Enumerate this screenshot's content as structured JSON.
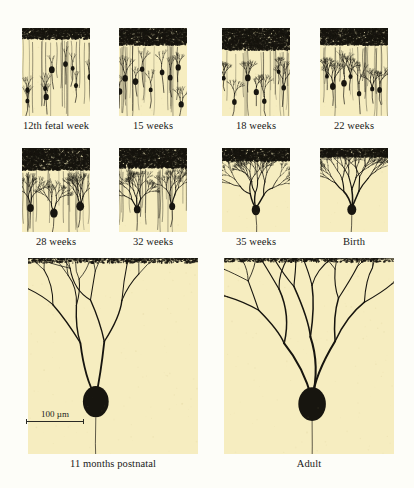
{
  "figure": {
    "background_color": "#fdfdf8",
    "panel_color": "#f6edc0",
    "ink_color": "#17150f"
  },
  "scale_bar": {
    "label": "100 µm",
    "length_um": 100,
    "panel": "11 months postnatal"
  },
  "panels": [
    {
      "id": "p1",
      "caption": "12th fetal week",
      "row": 1,
      "col": 1,
      "x": 22,
      "y": 28,
      "w": 68,
      "h": 88,
      "caption_y": 120,
      "granular_band_h": 11,
      "cell_count": 9,
      "arbor_stage": 0.05,
      "seed": 11
    },
    {
      "id": "p2",
      "caption": "15 weeks",
      "row": 1,
      "col": 2,
      "x": 119,
      "y": 28,
      "w": 68,
      "h": 88,
      "caption_y": 120,
      "granular_band_h": 17,
      "cell_count": 9,
      "arbor_stage": 0.12,
      "seed": 23
    },
    {
      "id": "p3",
      "caption": "18 weeks",
      "row": 1,
      "col": 3,
      "x": 222,
      "y": 28,
      "w": 68,
      "h": 88,
      "caption_y": 120,
      "granular_band_h": 22,
      "cell_count": 7,
      "arbor_stage": 0.2,
      "seed": 37
    },
    {
      "id": "p4",
      "caption": "22 weeks",
      "row": 1,
      "col": 4,
      "x": 320,
      "y": 28,
      "w": 68,
      "h": 88,
      "caption_y": 120,
      "granular_band_h": 17,
      "cell_count": 7,
      "arbor_stage": 0.26,
      "seed": 51
    },
    {
      "id": "p5",
      "caption": "28 weeks",
      "row": 2,
      "col": 1,
      "x": 22,
      "y": 148,
      "w": 68,
      "h": 84,
      "caption_y": 236,
      "granular_band_h": 22,
      "cell_count": 3,
      "arbor_stage": 0.34,
      "seed": 67
    },
    {
      "id": "p6",
      "caption": "32 weeks",
      "row": 2,
      "col": 2,
      "x": 119,
      "y": 148,
      "w": 68,
      "h": 84,
      "caption_y": 236,
      "granular_band_h": 20,
      "cell_count": 2,
      "arbor_stage": 0.44,
      "seed": 83
    },
    {
      "id": "p7",
      "caption": "35 weeks",
      "row": 2,
      "col": 3,
      "x": 222,
      "y": 148,
      "w": 68,
      "h": 84,
      "caption_y": 236,
      "granular_band_h": 13,
      "cell_count": 1,
      "arbor_stage": 0.58,
      "seed": 97
    },
    {
      "id": "p8",
      "caption": "Birth",
      "row": 2,
      "col": 4,
      "x": 320,
      "y": 148,
      "w": 68,
      "h": 84,
      "caption_y": 236,
      "granular_band_h": 9,
      "cell_count": 1,
      "arbor_stage": 0.68,
      "seed": 113
    },
    {
      "id": "p9",
      "caption": "11 months postnatal",
      "row": 3,
      "col": 1,
      "x": 28,
      "y": 258,
      "w": 170,
      "h": 196,
      "caption_y": 458,
      "granular_band_h": 5,
      "cell_count": 1,
      "arbor_stage": 0.88,
      "seed": 131
    },
    {
      "id": "p10",
      "caption": "Adult",
      "row": 3,
      "col": 2,
      "x": 224,
      "y": 258,
      "w": 170,
      "h": 196,
      "caption_y": 458,
      "granular_band_h": 4,
      "cell_count": 1,
      "arbor_stage": 1.0,
      "seed": 149
    }
  ],
  "captions": {
    "p1": "12th fetal week",
    "p2": "15 weeks",
    "p3": "18 weeks",
    "p4": "22 weeks",
    "p5": "28 weeks",
    "p6": "32 weeks",
    "p7": "35 weeks",
    "p8": "Birth",
    "p9": "11 months postnatal",
    "p10": "Adult"
  }
}
